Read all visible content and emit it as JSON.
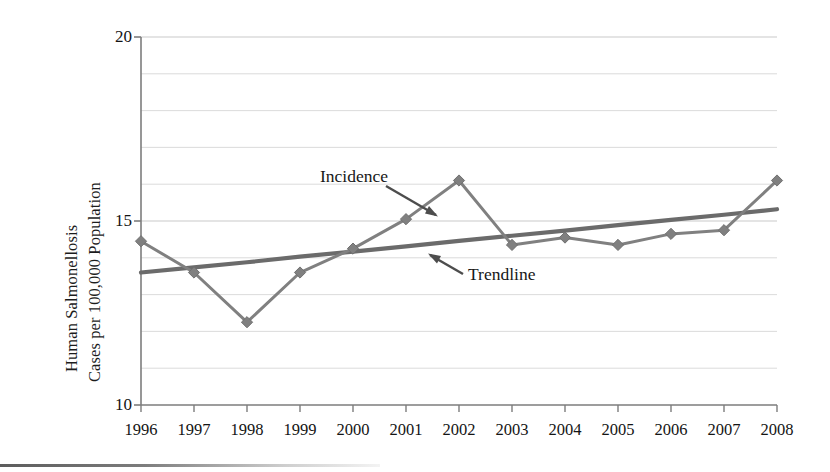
{
  "figure": {
    "background_color": "#ffffff",
    "line_color": "#808080",
    "trend_color": "#6b6b6b",
    "axis_color": "#7d7d7d",
    "grid_color": "#c8c8c8",
    "text_color": "#1a1a1a"
  },
  "axis": {
    "y_title_line1": "Human Salmonellosis",
    "y_title_line2": "Cases per 100,000 Population",
    "y_ticks": [
      "20",
      "15",
      "10"
    ],
    "x_ticks": [
      "1996",
      "1997",
      "1998",
      "1999",
      "2000",
      "2001",
      "2002",
      "2003",
      "2004",
      "2005",
      "2006",
      "2007",
      "2008"
    ]
  },
  "annotations": {
    "incidence": "Incidence",
    "trendline": "Trendline"
  },
  "chart_data": {
    "type": "line",
    "title": "",
    "xlabel": "",
    "ylabel": "Human Salmonellosis Cases per 100,000 Population",
    "x": [
      "1996",
      "1997",
      "1998",
      "1999",
      "2000",
      "2001",
      "2002",
      "2003",
      "2004",
      "2005",
      "2006",
      "2007",
      "2008"
    ],
    "xlim": [
      1996,
      2008
    ],
    "ylim": [
      10,
      20
    ],
    "y_major_ticks": [
      10,
      15,
      20
    ],
    "y_minor_gridlines": [
      11,
      12,
      13,
      14,
      16,
      17,
      18,
      19
    ],
    "grid": true,
    "legend": "none",
    "marker": "diamond",
    "series": [
      {
        "name": "Incidence",
        "values": [
          14.45,
          13.6,
          12.25,
          13.6,
          14.25,
          15.05,
          16.1,
          14.35,
          14.55,
          14.35,
          14.65,
          14.75,
          16.1
        ]
      },
      {
        "name": "Trendline",
        "type": "linear-fit",
        "values": [
          13.6,
          13.74,
          13.88,
          14.03,
          14.17,
          14.31,
          14.46,
          14.6,
          14.74,
          14.89,
          15.03,
          15.17,
          15.32
        ]
      }
    ]
  }
}
